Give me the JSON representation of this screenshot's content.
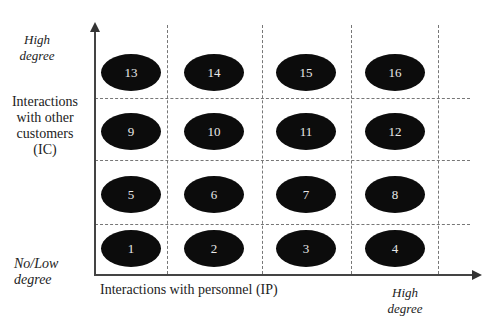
{
  "diagram": {
    "y_axis": {
      "title_lines": [
        "Interactions",
        "with other",
        "customers",
        "(IC)"
      ],
      "high_label": [
        "High",
        "degree"
      ],
      "low_label": [
        "No/Low",
        "degree"
      ]
    },
    "x_axis": {
      "title": "Interactions with personnel (IP)",
      "high_label": [
        "High",
        "degree"
      ]
    },
    "cells": [
      {
        "id": "1",
        "row": 0,
        "col": 0
      },
      {
        "id": "2",
        "row": 0,
        "col": 1
      },
      {
        "id": "3",
        "row": 0,
        "col": 2
      },
      {
        "id": "4",
        "row": 0,
        "col": 3
      },
      {
        "id": "5",
        "row": 1,
        "col": 0
      },
      {
        "id": "6",
        "row": 1,
        "col": 1
      },
      {
        "id": "7",
        "row": 1,
        "col": 2
      },
      {
        "id": "8",
        "row": 1,
        "col": 3
      },
      {
        "id": "9",
        "row": 2,
        "col": 0
      },
      {
        "id": "10",
        "row": 2,
        "col": 1
      },
      {
        "id": "11",
        "row": 2,
        "col": 2
      },
      {
        "id": "12",
        "row": 2,
        "col": 3
      },
      {
        "id": "13",
        "row": 3,
        "col": 0
      },
      {
        "id": "14",
        "row": 3,
        "col": 1
      },
      {
        "id": "15",
        "row": 3,
        "col": 2
      },
      {
        "id": "16",
        "row": 3,
        "col": 3
      }
    ],
    "colors": {
      "ellipse": "#0c0c0c",
      "ellipse_text": "#e8e8e8",
      "grid": "#777777",
      "axis": "#444444"
    }
  }
}
